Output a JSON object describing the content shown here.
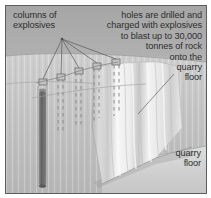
{
  "figure": {
    "domain": "diagram",
    "frame_border_color": "#5d5d5d",
    "background_color": "#b4b4b4"
  },
  "annotations": {
    "columns_of_explosives": "columns of\nexplosives",
    "holes_are_drilled": "holes are drilled and\ncharged with explosives\nto blast up to 30,000\ntonnes of rock\nonto the\nquarry\nfloor",
    "quarry_floor": "quarry\nfloor"
  },
  "colors": {
    "sky_band": "#a9a9a9",
    "ground_upper": "#c8c8c8",
    "ground_lower": "#bdbdbd",
    "rock_slab_light": "#f2f2f2",
    "rock_slab_shade": "#c9c9c9",
    "quarry_floor_plane": "#d4d4d4",
    "explosive_column": "#6f6f6f",
    "leader_line": "#6a6a6a",
    "dashed_hole": "#8e8e8e",
    "text": "#2f2f2f"
  },
  "elements": {
    "explosive_column_label": "solid explosive charge column",
    "drill_holes_label": "dashed drill holes",
    "hole_markers_label": "hole collar markers",
    "leader_fan_apex": "leader line convergence point",
    "rock_slab_label": "blasted rock face falling",
    "quarry_floor_label": "quarry floor plane"
  }
}
